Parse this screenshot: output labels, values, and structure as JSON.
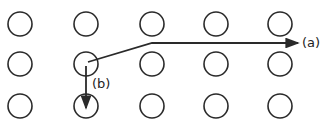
{
  "diagram": {
    "grid": {
      "columns_x": [
        20,
        86,
        152,
        216,
        280
      ],
      "rows_y": [
        24,
        64,
        106
      ],
      "radius": 12
    },
    "paths": [
      {
        "id": "a",
        "label": "(a)",
        "points": [
          [
            88,
            62
          ],
          [
            152,
            43
          ],
          [
            298,
            43
          ]
        ],
        "label_pos": [
          302,
          47
        ]
      },
      {
        "id": "b",
        "label": "(b)",
        "points": [
          [
            86,
            66
          ],
          [
            86,
            108
          ]
        ],
        "label_pos": [
          92,
          88
        ]
      }
    ],
    "colors": {
      "stroke": "#2a2a2a",
      "background": "#ffffff"
    }
  }
}
